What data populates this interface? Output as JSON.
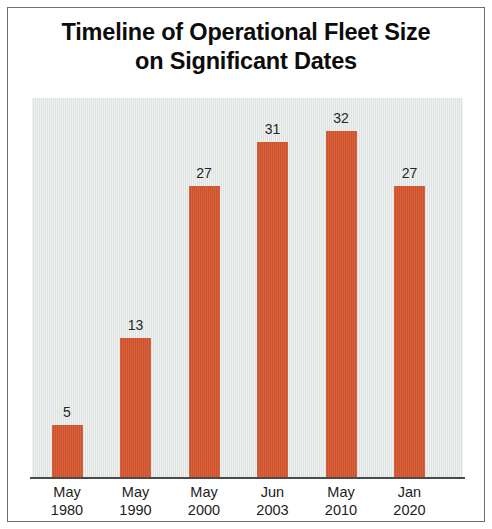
{
  "chart_data": {
    "type": "bar",
    "title": "Timeline of Operational Fleet Size on Significant Dates",
    "title_line1": "Timeline of Operational Fleet Size",
    "title_line2": "on Significant Dates",
    "xlabel": "",
    "ylabel": "",
    "grid": false,
    "legend": "none",
    "ylim": [
      0,
      35
    ],
    "bar_color": "#d0512a",
    "plot_background": "#dee2e1",
    "axis_color": "#4a4a4a",
    "label_color": "#262626",
    "categories": [
      "May 1980",
      "May 1990",
      "May 2000",
      "Jun 2003",
      "May 2010",
      "Jan 2020"
    ],
    "category_months": [
      "May",
      "May",
      "May",
      "Jun",
      "May",
      "Jan"
    ],
    "category_years": [
      "1980",
      "1990",
      "2000",
      "2003",
      "2010",
      "2020"
    ],
    "values": [
      5,
      13,
      27,
      31,
      32,
      27
    ],
    "data_labels": [
      "5",
      "13",
      "27",
      "31",
      "32",
      "27"
    ]
  }
}
